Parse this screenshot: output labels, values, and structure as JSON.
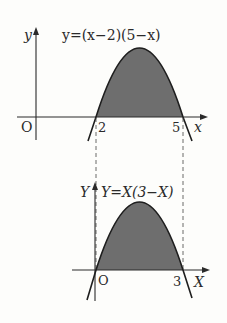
{
  "top_graph": {
    "y_axis_label": "y",
    "x_axis_label": "x",
    "origin_label": "O",
    "equation": "y=(x−2)(5−x)",
    "root_left_label": "2",
    "root_right_label": "5",
    "roots": [
      2,
      5
    ],
    "vertex": [
      3.5,
      2.25
    ]
  },
  "bottom_graph": {
    "y_axis_label": "Y",
    "x_axis_label": "X",
    "origin_label": "O",
    "equation": "Y=X(3−X)",
    "root_right_label": "3",
    "roots": [
      0,
      3
    ],
    "vertex": [
      1.5,
      2.25
    ]
  },
  "colors": {
    "fill": "#6e6e6e",
    "line": "#2a2a2a",
    "background": "#fdfdfb"
  }
}
